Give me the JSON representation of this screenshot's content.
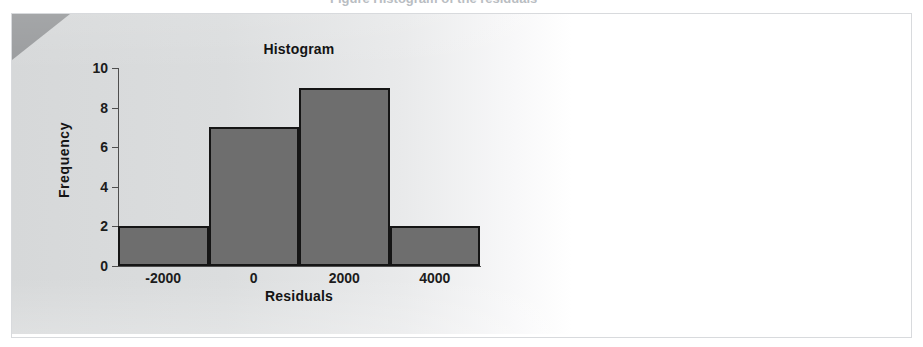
{
  "figure": {
    "panel_bg": "#d6d8d9",
    "dogear_color": "#9a9c9e",
    "frame_color": "#d8dadd"
  },
  "ghost": {
    "line": "Figure    Histogram of the residuals"
  },
  "chart_data": {
    "type": "bar",
    "title": "Histogram",
    "xlabel": "Residuals",
    "ylabel": "Frequency",
    "bar_color": "#6e6e6e",
    "bar_edge_color": "#151515",
    "grid": false,
    "legend": null,
    "xlim": [
      -3000,
      5000
    ],
    "ylim": [
      0,
      10
    ],
    "xticks": [
      -2000,
      0,
      2000,
      4000
    ],
    "xtick_labels": [
      "-2000",
      "0",
      "2000",
      "4000"
    ],
    "yticks": [
      0,
      2,
      4,
      6,
      8,
      10
    ],
    "ytick_labels": [
      "0",
      "2",
      "4",
      "6",
      "8",
      "10"
    ],
    "bin_width": 2000,
    "bin_edges": [
      -3000,
      -1000,
      1000,
      3000,
      5000
    ],
    "bins": [
      {
        "left": -3000,
        "right": -1000,
        "center": -2000,
        "frequency": 2
      },
      {
        "left": -1000,
        "right": 1000,
        "center": 0,
        "frequency": 7
      },
      {
        "left": 1000,
        "right": 3000,
        "center": 2000,
        "frequency": 9
      },
      {
        "left": 3000,
        "right": 5000,
        "center": 4000,
        "frequency": 2
      }
    ],
    "categories": [
      "-3000 to -1000",
      "-1000 to 1000",
      "1000 to 3000",
      "3000 to 5000"
    ],
    "values": [
      2,
      7,
      9,
      2
    ],
    "total_count": 20
  }
}
